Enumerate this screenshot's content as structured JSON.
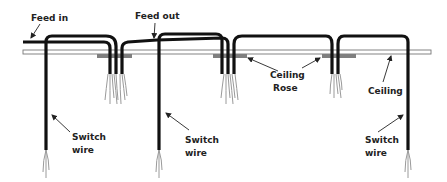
{
  "diagram": {
    "type": "wiring-diagram",
    "colors": {
      "cable": "#111111",
      "ceiling": "#ffffff",
      "ceiling_outline": "#777777",
      "rose": "#7f7f7f",
      "cores": "#9a9a9a",
      "text": "#222222"
    },
    "labels": {
      "feed_in": "Feed in",
      "feed_out": "Feed out",
      "ceiling_rose_line1": "Ceiling",
      "ceiling_rose_line2": "Rose",
      "ceiling": "Ceiling",
      "switch_wire_1_line1": "Switch",
      "switch_wire_1_line2": "wire",
      "switch_wire_2_line1": "Switch",
      "switch_wire_2_line2": "wire",
      "switch_wire_3_line1": "Switch",
      "switch_wire_3_line2": "wire"
    },
    "components": {
      "ceiling_roses": 3,
      "switch_wires": 3
    }
  }
}
